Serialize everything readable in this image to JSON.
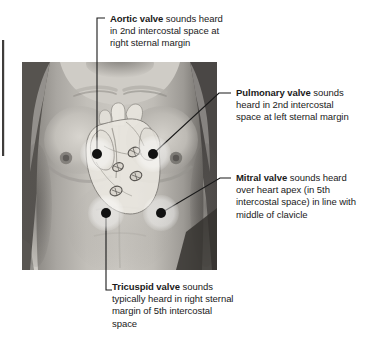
{
  "figure": {
    "kind": "anatomical-diagram",
    "image_region": {
      "x": 22,
      "y": 62,
      "width": 195,
      "height": 208
    },
    "photo_description": "grayscale photograph of a male torso, anterior chest",
    "overlay_description": "semi-transparent heart silhouette with four valve ovals"
  },
  "labels": {
    "aortic": {
      "valve": "Aortic valve",
      "text": " sounds heard in 2nd intercostal space at right sternal margin",
      "leader": "bracket-down"
    },
    "pulmonary": {
      "valve": "Pulmonary valve",
      "text": " sounds heard in 2nd intercostal space at left sternal margin",
      "leader": "diagonal-left-down"
    },
    "mitral": {
      "valve": "Mitral valve",
      "text": " sounds heard over heart apex (in 5th intercostal space) in line with middle of clavicle",
      "leader": "diagonal-left-down"
    },
    "tricuspid": {
      "valve": "Tricuspid valve",
      "text": " sounds typically heard in right sternal margin of 5th intercostal space",
      "leader": "bracket-up"
    }
  },
  "markers": [
    {
      "name": "aortic-marker",
      "cx": 97,
      "cy": 154,
      "halo_r": 17,
      "dot_r": 5
    },
    {
      "name": "pulmonary-marker",
      "cx": 153,
      "cy": 154,
      "halo_r": 18,
      "dot_r": 5
    },
    {
      "name": "tricuspid-marker",
      "cx": 106,
      "cy": 213,
      "halo_r": 18,
      "dot_r": 5
    },
    {
      "name": "mitral-marker",
      "cx": 161,
      "cy": 213,
      "halo_r": 18,
      "dot_r": 5
    }
  ],
  "colors": {
    "text": "#1a1a1a",
    "leader_line": "#1a1a1a",
    "marker_dot": "#111111",
    "marker_halo": "#ffffff",
    "heart_fill": "#ece9e2",
    "page_background": "#ffffff"
  }
}
